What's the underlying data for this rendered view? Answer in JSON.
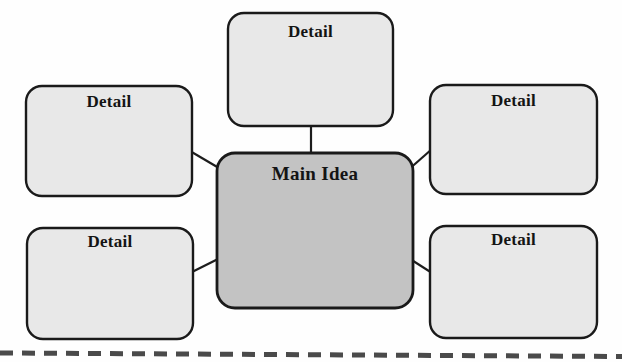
{
  "diagram": {
    "type": "main-idea-and-details web organizer",
    "center": {
      "id": "main-idea",
      "label": "Main Idea",
      "fill": "#c3c3c3",
      "stroke": "#1a1a1a",
      "x": 217,
      "y": 153,
      "width": 196,
      "height": 155,
      "radius": 18
    },
    "details": [
      {
        "id": "detail-top",
        "label": "Detail",
        "fill": "#e7e7e7",
        "stroke": "#1a1a1a",
        "x": 228,
        "y": 13,
        "width": 165,
        "height": 113,
        "radius": 16
      },
      {
        "id": "detail-top-left",
        "label": "Detail",
        "fill": "#e7e7e7",
        "stroke": "#1a1a1a",
        "x": 26,
        "y": 86,
        "width": 166,
        "height": 110,
        "radius": 16
      },
      {
        "id": "detail-top-right",
        "label": "Detail",
        "fill": "#e7e7e7",
        "stroke": "#1a1a1a",
        "x": 430,
        "y": 85,
        "width": 167,
        "height": 109,
        "radius": 16
      },
      {
        "id": "detail-bottom-left",
        "label": "Detail",
        "fill": "#e7e7e7",
        "stroke": "#1a1a1a",
        "x": 27,
        "y": 228,
        "width": 166,
        "height": 111,
        "radius": 16
      },
      {
        "id": "detail-bottom-right",
        "label": "Detail",
        "fill": "#e7e7e7",
        "stroke": "#1a1a1a",
        "x": 430,
        "y": 226,
        "width": 167,
        "height": 112,
        "radius": 16
      }
    ],
    "connectors": [
      {
        "id": "connector-top",
        "from": "detail-top",
        "to": "main-idea",
        "x1": 311,
        "y1": 126,
        "x2": 311,
        "y2": 154
      },
      {
        "id": "connector-top-left",
        "from": "detail-top-left",
        "to": "main-idea",
        "x1": 192,
        "y1": 152,
        "x2": 222,
        "y2": 170
      },
      {
        "id": "connector-top-right",
        "from": "detail-top-right",
        "to": "main-idea",
        "x1": 430,
        "y1": 150,
        "x2": 409,
        "y2": 170
      },
      {
        "id": "connector-bottom-left",
        "from": "detail-bottom-left",
        "to": "main-idea",
        "x1": 192,
        "y1": 272,
        "x2": 220,
        "y2": 258
      },
      {
        "id": "connector-bottom-right",
        "from": "detail-bottom-right",
        "to": "main-idea",
        "x1": 430,
        "y1": 272,
        "x2": 409,
        "y2": 258
      }
    ],
    "footer_rule": {
      "id": "dashed-rule",
      "style": "dashed",
      "color": "#4a4a4a",
      "x1": 0,
      "y1": 353,
      "x2": 622,
      "y2": 357
    }
  }
}
